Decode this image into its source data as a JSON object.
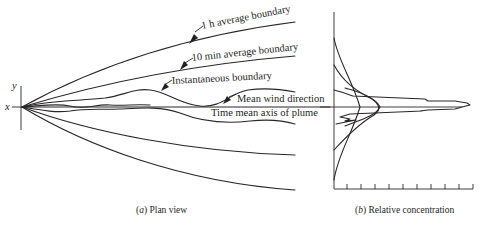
{
  "figure": {
    "panel_a": {
      "caption_letter": "a",
      "caption_text": "Plan view",
      "axes": {
        "x_label": "x",
        "y_label": "y"
      },
      "labels": {
        "one_hour": "1 h average boundary",
        "ten_min": "10 min average boundary",
        "instantaneous": "Instantaneous boundary",
        "mean_wind": "Mean wind direction",
        "time_mean_axis": "Time mean axis of plume"
      }
    },
    "panel_b": {
      "caption_letter": "b",
      "caption_text": "Relative concentration",
      "tick_count": 10
    },
    "colors": {
      "line": "#2a2627",
      "text": "#231f20",
      "background": "#ffffff"
    }
  }
}
